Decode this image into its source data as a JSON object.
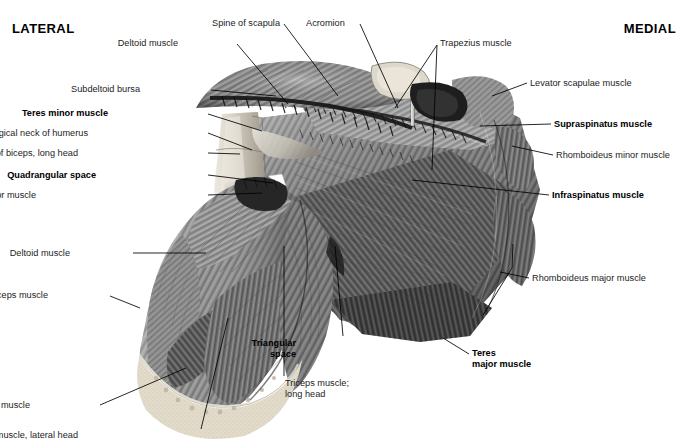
{
  "figure": {
    "orientation": {
      "lateral": "LATERAL",
      "medial": "MEDIAL"
    },
    "colors": {
      "background": "#ffffff",
      "label_text": "#1c1c1c",
      "leader_line": "#000000",
      "muscle_mid": "#8d8d8d",
      "muscle_dark": "#3a3a3a",
      "muscle_light": "#c9c9c9",
      "bone_cut": "#ded6c4",
      "tendon": "#cfcabf"
    },
    "labels": [
      {
        "id": "spine-of-scapula",
        "text": "Spine of scapula",
        "bold": false,
        "align": "right",
        "x": 280,
        "y": 18,
        "lines": [
          [
            284,
            24,
            338,
            96
          ]
        ]
      },
      {
        "id": "acromion",
        "text": "Acromion",
        "bold": false,
        "align": "left",
        "x": 306,
        "y": 18,
        "lines": [
          [
            360,
            24,
            398,
            108
          ]
        ]
      },
      {
        "id": "deltoid-muscle-top",
        "text": "Deltoid muscle",
        "bold": false,
        "align": "right",
        "x": 178,
        "y": 38,
        "lines": [
          [
            237,
            44,
            288,
            104
          ]
        ]
      },
      {
        "id": "trapezius-muscle",
        "text": "Trapezius muscle",
        "bold": false,
        "align": "left",
        "x": 440,
        "y": 38,
        "lines": [
          [
            437,
            45,
            395,
            108
          ],
          [
            437,
            45,
            432,
            170
          ]
        ]
      },
      {
        "id": "levator-scapulae-muscle",
        "text": "Levator scapulae muscle",
        "bold": false,
        "align": "left",
        "x": 530,
        "y": 78,
        "lines": [
          [
            527,
            83,
            492,
            96
          ]
        ]
      },
      {
        "id": "subdeltoid-bursa",
        "text": "Subdeltoid bursa",
        "bold": false,
        "align": "right",
        "x": 140,
        "y": 84,
        "lines": [
          [
            211,
            90,
            276,
            96
          ]
        ]
      },
      {
        "id": "teres-minor-muscle",
        "text": "Teres minor muscle",
        "bold": true,
        "align": "right",
        "x": 108,
        "y": 108,
        "lines": [
          [
            208,
            114,
            262,
            131
          ]
        ]
      },
      {
        "id": "supraspinatus-muscle",
        "text": "Supraspinatus muscle",
        "bold": true,
        "align": "left",
        "x": 554,
        "y": 119,
        "lines": [
          [
            551,
            124,
            480,
            126
          ]
        ]
      },
      {
        "id": "surgical-neck-of-humerus",
        "text": "Surgical neck of humerus",
        "bold": false,
        "align": "right",
        "x": 88,
        "y": 128,
        "lines": [
          [
            208,
            133,
            252,
            150
          ]
        ]
      },
      {
        "id": "rhomboideus-minor-muscle",
        "text": "Rhomboideus minor muscle",
        "bold": false,
        "align": "left",
        "x": 556,
        "y": 150,
        "lines": [
          [
            553,
            155,
            512,
            146
          ]
        ]
      },
      {
        "id": "tendon-of-biceps-long-head",
        "text": "Tendon of biceps, long head",
        "bold": false,
        "align": "right",
        "x": 78,
        "y": 148,
        "lines": [
          [
            208,
            153,
            240,
            154
          ]
        ]
      },
      {
        "id": "quadrangular-space",
        "text": "Quadrangular space",
        "bold": true,
        "align": "right",
        "x": 96,
        "y": 170,
        "lines": [
          [
            208,
            175,
            273,
            183
          ]
        ]
      },
      {
        "id": "infraspinatus-muscle",
        "text": "Infraspinatus muscle",
        "bold": true,
        "align": "left",
        "x": 552,
        "y": 190,
        "lines": [
          [
            549,
            195,
            412,
            180
          ]
        ]
      },
      {
        "id": "tendon-of-pectoralis-major-muscle",
        "text": "Tendon of pectoralis major muscle",
        "bold": false,
        "align": "right",
        "x": 36,
        "y": 190,
        "lines": [
          [
            208,
            195,
            262,
            193
          ]
        ]
      },
      {
        "id": "deltoid-muscle-arm",
        "text": "Deltoid muscle",
        "bold": false,
        "align": "right",
        "x": 70,
        "y": 248,
        "lines": [
          [
            133,
            253,
            206,
            253
          ]
        ]
      },
      {
        "id": "rhomboideus-major-muscle",
        "text": "Rhomboideus major muscle",
        "bold": false,
        "align": "left",
        "x": 532,
        "y": 273,
        "lines": [
          [
            529,
            278,
            500,
            272
          ],
          [
            512,
            268,
            513,
            244
          ],
          [
            512,
            268,
            483,
            315
          ]
        ]
      },
      {
        "id": "biceps-muscle",
        "text": "Biceps muscle",
        "bold": false,
        "align": "right",
        "x": 48,
        "y": 290,
        "lines": [
          [
            110,
            296,
            140,
            308
          ]
        ]
      },
      {
        "id": "triangular-space",
        "text": "Triangular\nspace",
        "bold": true,
        "align": "right",
        "x": 296,
        "y": 338,
        "lines": [
          [
            343,
            336,
            335,
            246
          ]
        ]
      },
      {
        "id": "teres-major-muscle",
        "text": "Teres\nmajor muscle",
        "bold": true,
        "align": "left",
        "x": 472,
        "y": 348,
        "lines": [
          [
            469,
            354,
            443,
            338
          ]
        ]
      },
      {
        "id": "triceps-muscle-long-head",
        "text": "Triceps muscle;\nlong head",
        "bold": false,
        "align": "left",
        "x": 285,
        "y": 378,
        "lines": [
          [
            284,
            376,
            284,
            246
          ]
        ]
      },
      {
        "id": "brachialis-muscle",
        "text": "Brachialis muscle",
        "bold": false,
        "align": "right",
        "x": 30,
        "y": 400,
        "lines": [
          [
            100,
            405,
            186,
            368
          ]
        ]
      },
      {
        "id": "triceps-muscle-lateral-head",
        "text": "Triceps muscle, lateral head",
        "bold": false,
        "align": "right",
        "x": 78,
        "y": 430,
        "lines": [
          [
            201,
            429,
            228,
            318
          ]
        ]
      }
    ]
  }
}
